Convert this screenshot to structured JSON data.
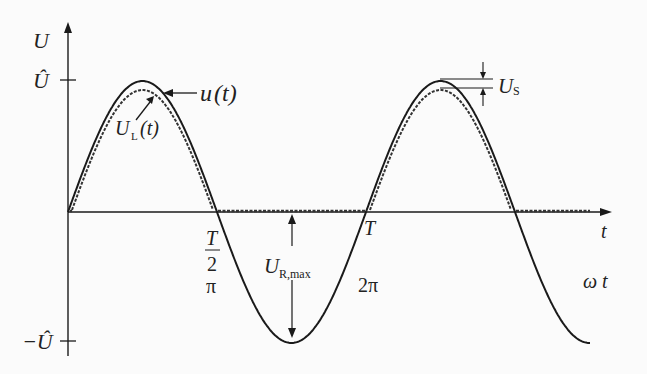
{
  "diagram": {
    "axes": {
      "y_label": "U",
      "x_label_time": "t",
      "x_label_angle": "ω t",
      "y_ticks": [
        {
          "label": "Û",
          "value": 1
        },
        {
          "label": "−Û",
          "value": -1
        }
      ],
      "x_ticks": [
        {
          "top": "T",
          "frac": "2",
          "bottom": "π",
          "position": "T/2"
        },
        {
          "top": "T",
          "bottom": "2π",
          "position": "T"
        }
      ]
    },
    "curves": [
      {
        "name": "u(t)",
        "style": "solid",
        "description": "sinusoidal input voltage",
        "color": "#1a1a1a"
      },
      {
        "name": "U_L(t)",
        "style": "dashed",
        "description": "load voltage (rectified, reduced by U_S)",
        "color": "#333333"
      }
    ],
    "annotations": {
      "u_label": "u",
      "u_arg": "(t)",
      "ul_main": "U",
      "ul_sub": "L",
      "ul_arg": "(t)",
      "us_main": "U",
      "us_sub": "S",
      "urmax_main": "U",
      "urmax_sub": "R,max"
    },
    "colors": {
      "ink": "#1a1a1a",
      "background": "#fbfbfb"
    }
  }
}
